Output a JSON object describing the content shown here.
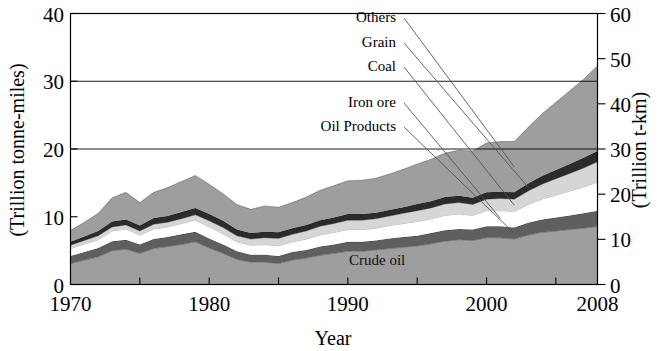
{
  "chart_data": {
    "type": "area",
    "stacked": true,
    "title": "",
    "xlabel": "Year",
    "ylabel": "(Trillion tonne-miles)",
    "ylabel_right": "(Trillion t-km)",
    "x": [
      1970,
      1971,
      1972,
      1973,
      1974,
      1975,
      1976,
      1977,
      1978,
      1979,
      1980,
      1981,
      1982,
      1983,
      1984,
      1985,
      1986,
      1987,
      1988,
      1989,
      1990,
      1991,
      1992,
      1993,
      1994,
      1995,
      1996,
      1997,
      1998,
      1999,
      2000,
      2001,
      2002,
      2003,
      2004,
      2005,
      2006,
      2007,
      2008
    ],
    "xlim": [
      1970,
      2008
    ],
    "ylim": [
      0,
      40
    ],
    "ylim_right": [
      0,
      60
    ],
    "xticks": [
      1970,
      1980,
      1990,
      2000,
      2008
    ],
    "xtick_labels": [
      "1970",
      "1980",
      "1990",
      "2000",
      "2008"
    ],
    "xticks_minor": [
      1975,
      1985,
      1995,
      2005
    ],
    "yticks": [
      0,
      10,
      20,
      30,
      40
    ],
    "ytick_labels": [
      "0",
      "10",
      "20",
      "30",
      "40"
    ],
    "yticks_right": [
      0,
      10,
      20,
      30,
      40,
      50,
      60
    ],
    "ytick_labels_right": [
      "0",
      "10",
      "20",
      "30",
      "40",
      "50",
      "60"
    ],
    "gridlines_y": [
      20,
      30
    ],
    "grid": true,
    "legend_position": "inline-callouts",
    "series": [
      {
        "name": "Crude oil",
        "color": "#9e9e9e",
        "label_kind": "inline",
        "values": [
          3.1,
          3.6,
          4.1,
          5.0,
          5.2,
          4.6,
          5.3,
          5.6,
          5.9,
          6.3,
          5.4,
          4.6,
          3.7,
          3.3,
          3.3,
          3.1,
          3.6,
          3.9,
          4.3,
          4.6,
          4.9,
          4.9,
          5.1,
          5.3,
          5.5,
          5.7,
          6.0,
          6.4,
          6.6,
          6.5,
          6.9,
          6.9,
          6.7,
          7.3,
          7.7,
          7.9,
          8.1,
          8.3,
          8.6
        ]
      },
      {
        "name": "Oil Products",
        "color": "#5f5f5f",
        "label_kind": "callout",
        "values": [
          1.1,
          1.2,
          1.3,
          1.4,
          1.4,
          1.3,
          1.4,
          1.4,
          1.5,
          1.5,
          1.4,
          1.3,
          1.2,
          1.1,
          1.1,
          1.1,
          1.2,
          1.2,
          1.3,
          1.3,
          1.4,
          1.4,
          1.4,
          1.5,
          1.5,
          1.5,
          1.6,
          1.6,
          1.6,
          1.6,
          1.7,
          1.7,
          1.7,
          1.8,
          1.9,
          2.0,
          2.1,
          2.2,
          2.3
        ]
      },
      {
        "name": "Iron ore",
        "color": "#ffffff",
        "label_kind": "callout",
        "values": [
          1.1,
          1.2,
          1.2,
          1.5,
          1.6,
          1.4,
          1.5,
          1.5,
          1.6,
          1.7,
          1.7,
          1.6,
          1.4,
          1.4,
          1.5,
          1.5,
          1.5,
          1.6,
          1.7,
          1.8,
          1.8,
          1.8,
          1.8,
          1.9,
          2.0,
          2.1,
          2.1,
          2.2,
          2.2,
          2.1,
          2.3,
          2.3,
          2.4,
          2.7,
          3.0,
          3.3,
          3.6,
          3.9,
          4.2
        ]
      },
      {
        "name": "Coal",
        "color": "#d6d6d6",
        "label_kind": "callout",
        "values": [
          0.5,
          0.5,
          0.6,
          0.6,
          0.6,
          0.6,
          0.7,
          0.7,
          0.7,
          0.8,
          0.9,
          0.9,
          0.9,
          0.9,
          1.0,
          1.1,
          1.1,
          1.2,
          1.3,
          1.3,
          1.4,
          1.4,
          1.4,
          1.4,
          1.5,
          1.6,
          1.6,
          1.7,
          1.7,
          1.6,
          1.7,
          1.8,
          1.8,
          2.0,
          2.2,
          2.4,
          2.6,
          2.8,
          3.0
        ]
      },
      {
        "name": "Grain",
        "color": "#2b2b2b",
        "label_kind": "callout",
        "values": [
          0.5,
          0.6,
          0.7,
          0.8,
          0.8,
          0.8,
          0.9,
          0.9,
          1.0,
          1.0,
          1.0,
          1.0,
          0.9,
          0.9,
          0.9,
          0.9,
          0.9,
          0.9,
          0.9,
          0.9,
          0.9,
          0.9,
          0.9,
          0.9,
          0.9,
          1.0,
          1.0,
          1.0,
          1.0,
          1.0,
          1.0,
          1.0,
          1.0,
          1.1,
          1.2,
          1.3,
          1.4,
          1.5,
          1.6
        ]
      },
      {
        "name": "Others",
        "color": "#9e9e9e",
        "label_kind": "callout",
        "values": [
          1.7,
          2.1,
          2.6,
          3.5,
          4.0,
          3.4,
          3.8,
          4.2,
          4.5,
          4.8,
          4.4,
          4.0,
          3.7,
          3.5,
          3.8,
          3.7,
          3.8,
          4.1,
          4.4,
          4.7,
          4.9,
          5.0,
          5.1,
          5.3,
          5.6,
          5.9,
          6.2,
          6.5,
          6.7,
          6.9,
          7.3,
          7.4,
          7.5,
          8.3,
          9.2,
          10.0,
          10.8,
          11.6,
          12.6
        ]
      }
    ],
    "annotations": [
      {
        "text": "Others",
        "x_px": 396,
        "y_px": 22
      },
      {
        "text": "Grain",
        "x_px": 396,
        "y_px": 47
      },
      {
        "text": "Coal",
        "x_px": 396,
        "y_px": 71
      },
      {
        "text": "Iron ore",
        "x_px": 396,
        "y_px": 107
      },
      {
        "text": "Oil Products",
        "x_px": 396,
        "y_px": 131
      },
      {
        "text": "Crude oil",
        "x_px": 349,
        "y_px": 265
      }
    ]
  }
}
